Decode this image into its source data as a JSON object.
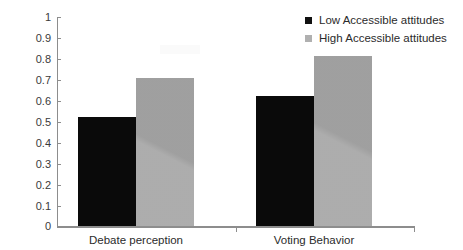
{
  "chart_data": {
    "type": "bar",
    "title": "",
    "subtitle": "",
    "xlabel": "",
    "ylabel": "",
    "categories": [
      "Debate perception",
      "Voting Behavior"
    ],
    "series": [
      {
        "name": "Low Accessible attitudes",
        "color": "#0a0a0a",
        "values": [
          0.52,
          0.62
        ]
      },
      {
        "name": "High Accessible attitudes",
        "color": "#a8a8a8",
        "values": [
          0.71,
          0.815
        ]
      }
    ],
    "ylim": [
      0,
      1
    ],
    "ytick_labels": [
      "1",
      "0.9",
      "0.8",
      "0.7",
      "0.6",
      "0.5",
      "0.4",
      "0.3",
      "0.2",
      "0.1",
      "0"
    ],
    "ytick_values": [
      1,
      0.9,
      0.8,
      0.7,
      0.6,
      0.5,
      0.4,
      0.3,
      0.2,
      0.1,
      0
    ],
    "grid": false,
    "legend_position": "top-right"
  },
  "axes": {
    "y_ticks": [
      {
        "label": "1",
        "value": 1
      },
      {
        "label": "0.9",
        "value": 0.9
      },
      {
        "label": "0.8",
        "value": 0.8
      },
      {
        "label": "0.7",
        "value": 0.7
      },
      {
        "label": "0.6",
        "value": 0.6
      },
      {
        "label": "0.5",
        "value": 0.5
      },
      {
        "label": "0.4",
        "value": 0.4
      },
      {
        "label": "0.3",
        "value": 0.3
      },
      {
        "label": "0.2",
        "value": 0.2
      },
      {
        "label": "0.1",
        "value": 0.1
      },
      {
        "label": "0",
        "value": 0
      }
    ],
    "x_labels": [
      "Debate perception",
      "Voting Behavior"
    ]
  },
  "legend": {
    "items": [
      {
        "label": "Low Accessible attitudes",
        "color": "#111111",
        "icon": "square-swatch-icon"
      },
      {
        "label": "High Accessible attitudes",
        "color": "#b0b0b0",
        "icon": "square-swatch-icon"
      }
    ]
  },
  "colors": {
    "low_accessible": "#0a0a0a",
    "high_accessible": "#a8a8a8",
    "axis": "#8d8d8d",
    "background": "#ffffff",
    "text": "#2b2b2b"
  }
}
